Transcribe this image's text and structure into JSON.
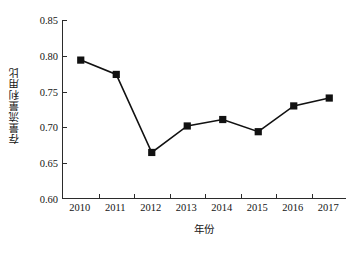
{
  "chart_data": {
    "type": "line",
    "title": "",
    "xlabel": "年份",
    "ylabel": "存量流量利用比",
    "categories": [
      "2010",
      "2011",
      "2012",
      "2013",
      "2014",
      "2015",
      "2016",
      "2017"
    ],
    "values": [
      0.794,
      0.774,
      0.665,
      0.702,
      0.711,
      0.694,
      0.73,
      0.741
    ],
    "series": [
      {
        "name": "存量流量利用比",
        "values": [
          0.794,
          0.774,
          0.665,
          0.702,
          0.711,
          0.694,
          0.73,
          0.741
        ]
      }
    ],
    "ylim": [
      0.6,
      0.85
    ],
    "yticks": [
      "0.85",
      "0.80",
      "0.75",
      "0.70",
      "0.65",
      "0.60"
    ],
    "ytick_values": [
      0.85,
      0.8,
      0.75,
      0.7,
      0.65,
      0.6
    ],
    "xticks": [
      "2010",
      "2011",
      "2012",
      "2013",
      "2014",
      "2015",
      "2016",
      "2017"
    ],
    "grid": false,
    "legend": "none",
    "marker": "filled-square",
    "line_color": "#111111",
    "marker_color": "#111111",
    "axis_color": "#2b2b2b"
  }
}
